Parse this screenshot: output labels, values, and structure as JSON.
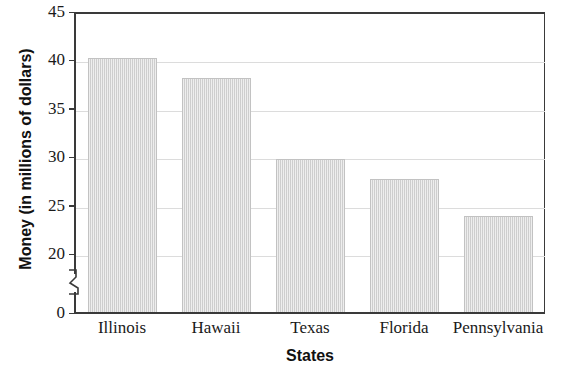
{
  "chart_data": {
    "type": "bar",
    "title": "",
    "xlabel": "States",
    "ylabel": "Money (in millions of dollars)",
    "categories": [
      "Illinois",
      "Hawaii",
      "Texas",
      "Florida",
      "Pennsylvania"
    ],
    "values": [
      40.3,
      38.2,
      29.8,
      27.8,
      23.9
    ],
    "ylim": [
      0,
      45
    ],
    "yticks": [
      0,
      20,
      25,
      30,
      35,
      40,
      45
    ],
    "ytick_labels": [
      "0",
      "20",
      "25",
      "30",
      "35",
      "40",
      "45"
    ],
    "axis_break": true,
    "axis_break_between": [
      0,
      20
    ],
    "grid": true,
    "grid_axis": "y",
    "legend": null,
    "bar_color": "#d9d9d9",
    "bar_edge_color": "#c2c2c2",
    "axis_color": "#3a3a3a",
    "grid_color": "#dcdcdc",
    "background_color": "#ffffff"
  },
  "axes": {
    "y_title": "Money (in millions of dollars)",
    "x_title": "States"
  },
  "ticks": {
    "y": [
      {
        "label": "45",
        "value": 45
      },
      {
        "label": "40",
        "value": 40
      },
      {
        "label": "35",
        "value": 35
      },
      {
        "label": "30",
        "value": 30
      },
      {
        "label": "25",
        "value": 25
      },
      {
        "label": "20",
        "value": 20
      },
      {
        "label": "0",
        "value": 0
      }
    ]
  },
  "bars": [
    {
      "label": "Illinois",
      "value": 40.3
    },
    {
      "label": "Hawaii",
      "value": 38.2
    },
    {
      "label": "Texas",
      "value": 29.8
    },
    {
      "label": "Florida",
      "value": 27.8
    },
    {
      "label": "Pennsylvania",
      "value": 23.9
    }
  ]
}
